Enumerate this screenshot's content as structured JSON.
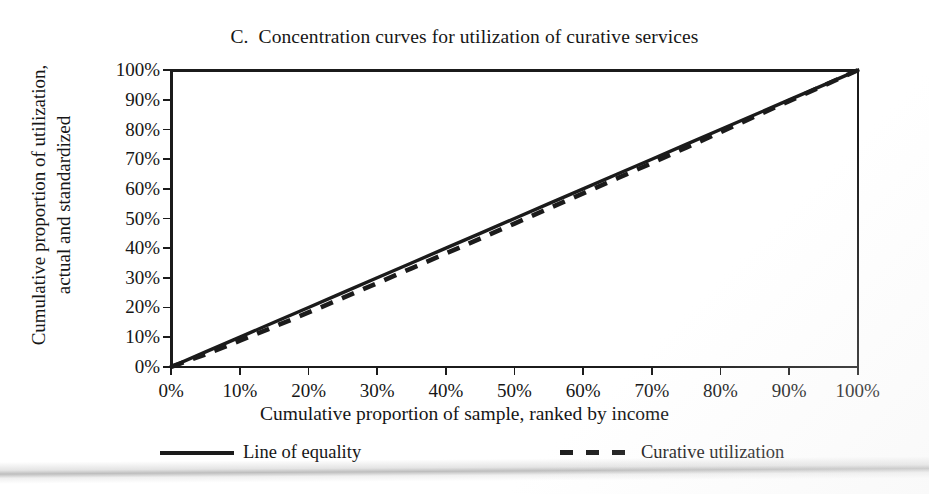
{
  "figure": {
    "panel_label": "C.",
    "title": "C.  Concentration curves for utilization of curative services"
  },
  "axes": {
    "ylabel_line1": "Cumulative proportion of utilization,",
    "ylabel_line2": "actual and standardized",
    "xlabel": "Cumulative proportion of sample, ranked by income",
    "yticks": [
      "100%",
      "90%",
      "80%",
      "70%",
      "60%",
      "50%",
      "40%",
      "30%",
      "20%",
      "10%",
      "0%"
    ],
    "xticks": [
      "0%",
      "10%",
      "20%",
      "30%",
      "40%",
      "50%",
      "60%",
      "70%",
      "80%",
      "90%",
      "100%"
    ]
  },
  "legend": {
    "equality_label": "Line of equality",
    "curative_label": "Curative utilization"
  },
  "colors": {
    "ink": "#1b1b1b",
    "paper": "#ffffff"
  },
  "chart_data": {
    "type": "line",
    "title": "C.  Concentration curves for utilization of curative services",
    "xlabel": "Cumulative proportion of sample, ranked by income",
    "ylabel": "Cumulative proportion of utilization, actual and standardized",
    "xlim": [
      0,
      100
    ],
    "ylim": [
      0,
      100
    ],
    "xticks": [
      0,
      10,
      20,
      30,
      40,
      50,
      60,
      70,
      80,
      90,
      100
    ],
    "yticks": [
      0,
      10,
      20,
      30,
      40,
      50,
      60,
      70,
      80,
      90,
      100
    ],
    "grid": false,
    "legend_position": "below-axis",
    "x": [
      0,
      5,
      10,
      15,
      20,
      25,
      30,
      35,
      40,
      45,
      50,
      55,
      60,
      65,
      70,
      75,
      80,
      85,
      90,
      95,
      100
    ],
    "series": [
      {
        "name": "Line of equality",
        "style": "solid",
        "values": [
          0,
          5,
          10,
          15,
          20,
          25,
          30,
          35,
          40,
          45,
          50,
          55,
          60,
          65,
          70,
          75,
          80,
          85,
          90,
          95,
          100
        ]
      },
      {
        "name": "Curative utilization",
        "style": "dashed",
        "values": [
          0,
          4.2,
          8.8,
          13.5,
          18.3,
          23.2,
          28.2,
          33.2,
          38.2,
          43.2,
          48.3,
          53.4,
          58.5,
          63.6,
          68.7,
          73.9,
          79.1,
          84.4,
          89.6,
          94.8,
          100
        ]
      }
    ]
  }
}
